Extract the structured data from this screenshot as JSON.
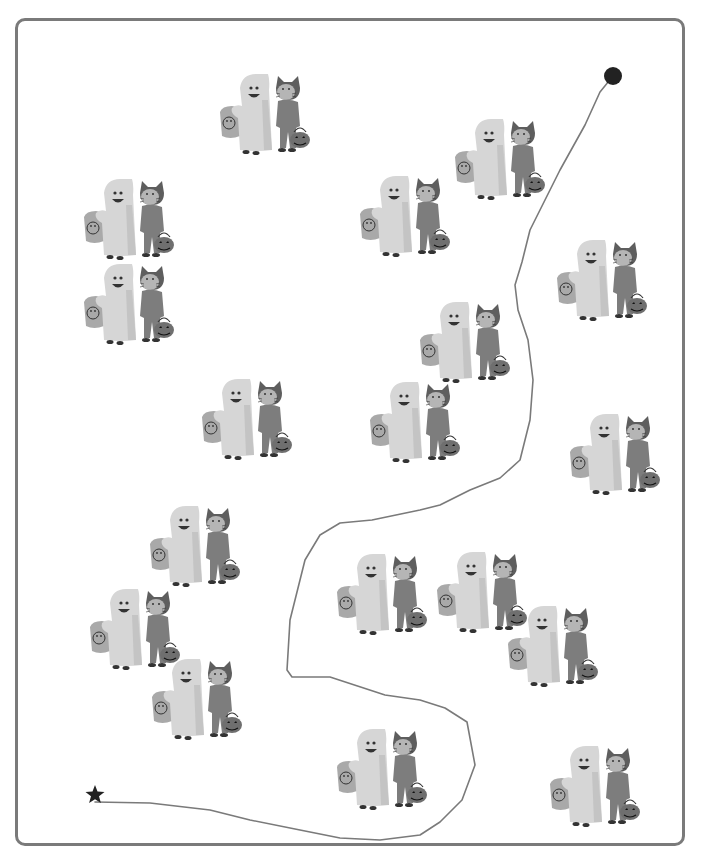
{
  "puzzle": {
    "title": "",
    "frame_color": "#7a7a7a",
    "line_color": "#7a7a7a",
    "start_marker": {
      "icon": "star-icon",
      "x": 95,
      "y": 795,
      "color": "#222222"
    },
    "end_marker": {
      "icon": "dot-icon",
      "x": 613,
      "y": 76,
      "color": "#222222"
    },
    "path_points": [
      [
        95,
        802
      ],
      [
        150,
        803
      ],
      [
        210,
        810
      ],
      [
        250,
        820
      ],
      [
        300,
        830
      ],
      [
        340,
        838
      ],
      [
        380,
        840
      ],
      [
        420,
        835
      ],
      [
        440,
        822
      ],
      [
        462,
        800
      ],
      [
        475,
        765
      ],
      [
        467,
        722
      ],
      [
        445,
        708
      ],
      [
        420,
        700
      ],
      [
        385,
        695
      ],
      [
        330,
        677
      ],
      [
        292,
        677
      ],
      [
        287,
        670
      ],
      [
        290,
        620
      ],
      [
        305,
        560
      ],
      [
        320,
        535
      ],
      [
        340,
        523
      ],
      [
        372,
        520
      ],
      [
        420,
        510
      ],
      [
        440,
        505
      ],
      [
        470,
        490
      ],
      [
        500,
        478
      ],
      [
        520,
        460
      ],
      [
        530,
        420
      ],
      [
        533,
        380
      ],
      [
        528,
        340
      ],
      [
        518,
        310
      ],
      [
        515,
        285
      ],
      [
        522,
        262
      ],
      [
        530,
        230
      ],
      [
        560,
        170
      ],
      [
        585,
        125
      ],
      [
        600,
        92
      ],
      [
        613,
        76
      ]
    ],
    "figures": [
      {
        "label": "ghost-and-cat",
        "x": 218,
        "y": 70
      },
      {
        "label": "ghost-and-cat",
        "x": 453,
        "y": 115
      },
      {
        "label": "ghost-and-cat",
        "x": 358,
        "y": 172
      },
      {
        "label": "ghost-and-cat",
        "x": 82,
        "y": 175
      },
      {
        "label": "ghost-and-cat",
        "x": 82,
        "y": 260
      },
      {
        "label": "ghost-and-cat",
        "x": 555,
        "y": 236
      },
      {
        "label": "ghost-and-cat",
        "x": 418,
        "y": 298
      },
      {
        "label": "ghost-and-cat",
        "x": 200,
        "y": 375
      },
      {
        "label": "ghost-and-cat",
        "x": 368,
        "y": 378
      },
      {
        "label": "ghost-and-cat",
        "x": 568,
        "y": 410
      },
      {
        "label": "ghost-and-cat",
        "x": 148,
        "y": 502
      },
      {
        "label": "ghost-and-cat",
        "x": 335,
        "y": 550
      },
      {
        "label": "ghost-and-cat",
        "x": 435,
        "y": 548
      },
      {
        "label": "ghost-and-cat",
        "x": 88,
        "y": 585
      },
      {
        "label": "ghost-and-cat",
        "x": 506,
        "y": 602
      },
      {
        "label": "ghost-and-cat",
        "x": 150,
        "y": 655
      },
      {
        "label": "ghost-and-cat",
        "x": 335,
        "y": 725
      },
      {
        "label": "ghost-and-cat",
        "x": 548,
        "y": 742
      }
    ],
    "colors": {
      "ghost": "#d6d6d6",
      "ghost_shade": "#c4c4c4",
      "bucket": "#a9a9a9",
      "cat": "#7d7d7d",
      "cat_dark": "#5e5e5e",
      "pumpkin": "#6f6f6f",
      "ink": "#333333"
    }
  }
}
